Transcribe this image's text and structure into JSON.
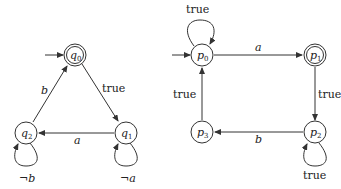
{
  "automata": [
    {
      "name": "left-automaton",
      "states": [
        {
          "id": "q0",
          "label": "q",
          "sub": "0",
          "initial": true,
          "accepting": true
        },
        {
          "id": "q1",
          "label": "q",
          "sub": "1",
          "initial": false,
          "accepting": false
        },
        {
          "id": "q2",
          "label": "q",
          "sub": "2",
          "initial": false,
          "accepting": false
        }
      ],
      "transitions": [
        {
          "from": "q0",
          "to": "q1",
          "label": "true"
        },
        {
          "from": "q1",
          "to": "q2",
          "label": "a"
        },
        {
          "from": "q2",
          "to": "q0",
          "label": "b"
        },
        {
          "from": "q1",
          "to": "q1",
          "label": "¬a"
        },
        {
          "from": "q2",
          "to": "q2",
          "label": "¬b"
        }
      ]
    },
    {
      "name": "right-automaton",
      "states": [
        {
          "id": "p0",
          "label": "p",
          "sub": "0",
          "initial": true,
          "accepting": false
        },
        {
          "id": "p1",
          "label": "p",
          "sub": "1",
          "initial": false,
          "accepting": true
        },
        {
          "id": "p2",
          "label": "p",
          "sub": "2",
          "initial": false,
          "accepting": false
        },
        {
          "id": "p3",
          "label": "p",
          "sub": "3",
          "initial": false,
          "accepting": false
        }
      ],
      "transitions": [
        {
          "from": "p0",
          "to": "p0",
          "label": "true"
        },
        {
          "from": "p0",
          "to": "p1",
          "label": "a"
        },
        {
          "from": "p1",
          "to": "p2",
          "label": "true"
        },
        {
          "from": "p2",
          "to": "p3",
          "label": "b"
        },
        {
          "from": "p2",
          "to": "p2",
          "label": "true"
        },
        {
          "from": "p3",
          "to": "p0",
          "label": "true"
        }
      ]
    }
  ],
  "colors": {
    "stroke": "#333333",
    "text": "#222222",
    "background": "#ffffff"
  }
}
